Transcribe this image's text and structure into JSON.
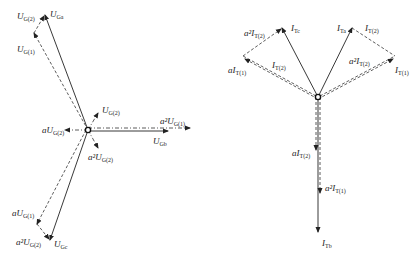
{
  "left_diagram": {
    "title": "Voltage phasors (G side)",
    "labels": {
      "U_G2_top": {
        "pre": "",
        "sym": "U",
        "sub": "G(2)"
      },
      "U_Ga": {
        "pre": "",
        "sym": "U",
        "sub": "Ga"
      },
      "U_G1_top": {
        "pre": "",
        "sym": "U",
        "sub": "G(1)"
      },
      "U_G2_mid": {
        "pre": "",
        "sym": "U",
        "sub": "G(2)"
      },
      "aU_G2": {
        "pre": "a",
        "sym": "U",
        "sub": "G(2)"
      },
      "a2U_G1_right": {
        "pre": "a²",
        "sym": "U",
        "sub": "G(1)"
      },
      "U_Gb": {
        "pre": "",
        "sym": "U",
        "sub": "Gb"
      },
      "a2U_G2_mid": {
        "pre": "a²",
        "sym": "U",
        "sub": "G(2)"
      },
      "aU_G1": {
        "pre": "a",
        "sym": "U",
        "sub": "G(1)"
      },
      "a2U_G2_bottom": {
        "pre": "a²",
        "sym": "U",
        "sub": "G(2)"
      },
      "U_Gc": {
        "pre": "",
        "sym": "U",
        "sub": "Gc"
      }
    }
  },
  "right_diagram": {
    "title": "Current phasors (T side)",
    "labels": {
      "a2I_T2_left": {
        "pre": "a²",
        "sym": "I",
        "sub": "T(2)"
      },
      "I_Tc": {
        "pre": "",
        "sym": "I",
        "sub": "Tc"
      },
      "aI_T1": {
        "pre": "a",
        "sym": "I",
        "sub": "T(1)"
      },
      "I_T2_left": {
        "pre": "",
        "sym": "I",
        "sub": "T(2)"
      },
      "I_Ta": {
        "pre": "",
        "sym": "I",
        "sub": "Ta"
      },
      "I_T2_right": {
        "pre": "",
        "sym": "I",
        "sub": "T(2)"
      },
      "a2I_T2_right": {
        "pre": "a²",
        "sym": "I",
        "sub": "T(2)"
      },
      "I_T1": {
        "pre": "",
        "sym": "I",
        "sub": "T(1)"
      },
      "aI_T2": {
        "pre": "a",
        "sym": "I",
        "sub": "T(2)"
      },
      "a2I_T1": {
        "pre": "a²",
        "sym": "I",
        "sub": "T(1)"
      },
      "I_Tb": {
        "pre": "",
        "sym": "I",
        "sub": "Tb"
      }
    }
  }
}
